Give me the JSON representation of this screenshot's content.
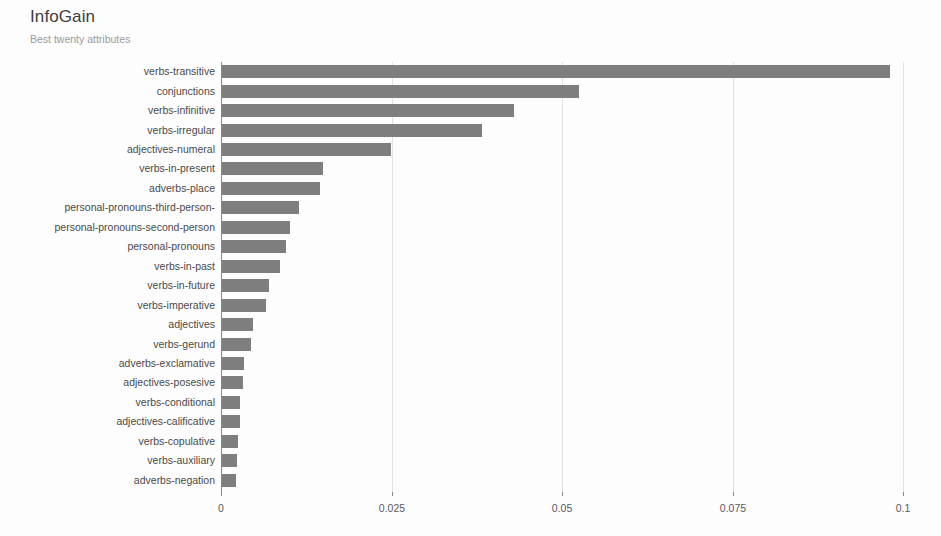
{
  "header": {
    "title": "InfoGain",
    "subtitle": "Best twenty attributes"
  },
  "chart_data": {
    "type": "bar",
    "orientation": "horizontal",
    "title": "InfoGain",
    "subtitle": "Best twenty attributes",
    "xlabel": "",
    "ylabel": "",
    "xlim": [
      0,
      0.105
    ],
    "xticks": [
      0,
      0.025,
      0.05,
      0.075,
      0.1
    ],
    "xticklabels": [
      "0",
      "0.025",
      "0.05",
      "0.075",
      "0.1"
    ],
    "grid": "vertical",
    "legend": null,
    "bar_color": "#7e7e7e",
    "categories": [
      "verbs-transitive",
      "conjunctions",
      "verbs-infinitive",
      "verbs-irregular",
      "adjectives-numeral",
      "verbs-in-present",
      "adverbs-place",
      "personal-pronouns-third-person-",
      "personal-pronouns-second-person",
      "personal-pronouns",
      "verbs-in-past",
      "verbs-in-future",
      "verbs-imperative",
      "adjectives",
      "verbs-gerund",
      "adverbs-exclamative",
      "adjectives-posesive",
      "verbs-conditional",
      "adjectives-calificative",
      "verbs-copulative",
      "verbs-auxiliary",
      "adverbs-negation"
    ],
    "values": [
      0.098,
      0.0523,
      0.0428,
      0.0381,
      0.0248,
      0.0148,
      0.0143,
      0.0113,
      0.0099,
      0.0094,
      0.0085,
      0.0069,
      0.0064,
      0.0046,
      0.0043,
      0.0032,
      0.0031,
      0.0027,
      0.0026,
      0.0024,
      0.0022,
      0.0021
    ]
  },
  "layout": {
    "plot_left": 221,
    "plot_right": 903,
    "plot_top": 62,
    "bar_pitch": 19.45,
    "bar_height": 13,
    "axis_bottom": 492
  }
}
